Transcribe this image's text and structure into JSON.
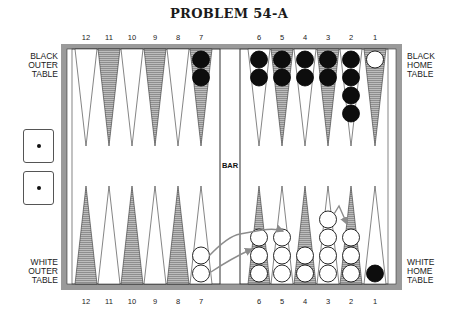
{
  "title": "PROBLEM 54-A",
  "labels": {
    "black_outer": "BLACK\nOUTER\nTABLE",
    "black_home": "BLACK\nHOME\nTABLE",
    "white_outer": "WHITE\nOUTER\nTABLE",
    "white_home": "WHITE\nHOME\nTABLE",
    "bar": "BAR"
  },
  "colors": {
    "frame": "#9a9a9a",
    "shaded_point": "#a8a8a8",
    "line": "#333333",
    "black_checker": "#0d0d0d",
    "white_checker": "#ffffff",
    "arrow": "#8c8c8c"
  },
  "dice": [
    {
      "value": 1
    },
    {
      "value": 1
    }
  ],
  "top_points": [
    {
      "label": "12",
      "black": 0,
      "white": 0,
      "shaded": false
    },
    {
      "label": "11",
      "black": 0,
      "white": 0,
      "shaded": true
    },
    {
      "label": "10",
      "black": 0,
      "white": 0,
      "shaded": false
    },
    {
      "label": "9",
      "black": 0,
      "white": 0,
      "shaded": true
    },
    {
      "label": "8",
      "black": 0,
      "white": 0,
      "shaded": false
    },
    {
      "label": "7",
      "black": 2,
      "white": 0,
      "shaded": true
    },
    {
      "label": "6",
      "black": 2,
      "white": 0,
      "shaded": false
    },
    {
      "label": "5",
      "black": 2,
      "white": 0,
      "shaded": true
    },
    {
      "label": "4",
      "black": 2,
      "white": 0,
      "shaded": false
    },
    {
      "label": "3",
      "black": 2,
      "white": 0,
      "shaded": true
    },
    {
      "label": "2",
      "black": 4,
      "white": 0,
      "shaded": false
    },
    {
      "label": "1",
      "black": 0,
      "white": 1,
      "shaded": true
    }
  ],
  "bottom_points": [
    {
      "label": "12",
      "black": 0,
      "white": 0,
      "shaded": true
    },
    {
      "label": "11",
      "black": 0,
      "white": 0,
      "shaded": false
    },
    {
      "label": "10",
      "black": 0,
      "white": 0,
      "shaded": true
    },
    {
      "label": "9",
      "black": 0,
      "white": 0,
      "shaded": false
    },
    {
      "label": "8",
      "black": 0,
      "white": 0,
      "shaded": true
    },
    {
      "label": "7",
      "black": 0,
      "white": 2,
      "shaded": false
    },
    {
      "label": "6",
      "black": 0,
      "white": 3,
      "shaded": true
    },
    {
      "label": "5",
      "black": 0,
      "white": 3,
      "shaded": false
    },
    {
      "label": "4",
      "black": 0,
      "white": 2,
      "shaded": true
    },
    {
      "label": "3",
      "black": 0,
      "white": 4,
      "shaded": false
    },
    {
      "label": "2",
      "black": 0,
      "white": 3,
      "shaded": true
    },
    {
      "label": "1",
      "black": 1,
      "white": 0,
      "shaded": false
    }
  ],
  "arrows": [
    {
      "from": "7",
      "to": "5",
      "path": "M209,256 Q228,236 240,234 L262,230 Q275,228 283,231"
    },
    {
      "from": "7",
      "to": "6",
      "path": "M211,272 Q232,258 252,249"
    },
    {
      "from": "3",
      "to": "2",
      "path": "M334,214 L339,206 L347,224"
    }
  ]
}
